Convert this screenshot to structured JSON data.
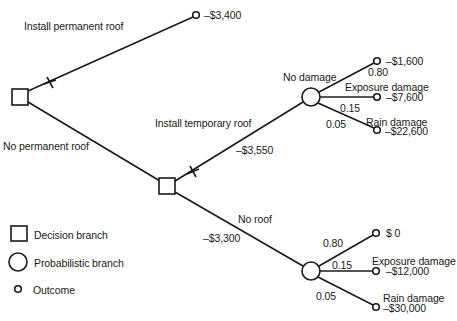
{
  "diagram": {
    "type": "decision-tree",
    "root": {
      "kind": "decision",
      "branches": [
        {
          "label": "Install permanent roof",
          "rejected": true,
          "outcome": "–$3,400"
        },
        {
          "label": "No permanent roof",
          "node": {
            "kind": "decision",
            "branches": [
              {
                "label": "Install temporary roof",
                "cost": "–$3,550",
                "rejected": true,
                "node": {
                  "kind": "probabilistic",
                  "outcomes": [
                    {
                      "label": "No damage",
                      "probability": "0.80",
                      "value": "–$1,600"
                    },
                    {
                      "label": "Exposure damage",
                      "probability": "0.15",
                      "value": "–$7,600"
                    },
                    {
                      "label": "Rain damage",
                      "probability": "0.05",
                      "value": "–$22,600"
                    }
                  ]
                }
              },
              {
                "label": "No roof",
                "cost": "–$3,300",
                "node": {
                  "kind": "probabilistic",
                  "outcomes": [
                    {
                      "label": "",
                      "probability": "0.80",
                      "value": "$ 0"
                    },
                    {
                      "label": "Exposure damage",
                      "probability": "0.15",
                      "value": "–$12,000"
                    },
                    {
                      "label": "Rain damage",
                      "probability": "0.05",
                      "value": "–$30,000"
                    }
                  ]
                }
              }
            ]
          }
        }
      ]
    }
  },
  "labels": {
    "install_permanent": "Install permanent roof",
    "permanent_value": "–$3,400",
    "no_permanent": "No permanent roof",
    "install_temporary": "Install temporary roof",
    "temporary_cost": "–$3,550",
    "no_roof": "No roof",
    "no_roof_cost": "–$3,300",
    "upper": {
      "no_damage": "No damage",
      "p1": "0.80",
      "v1": "–$1,600",
      "exposure": "Exposure damage",
      "p2": "0.15",
      "v2": "–$7,600",
      "rain": "Rain damage",
      "p3": "0.05",
      "v3": "–$22,600"
    },
    "lower": {
      "p1": "0.80",
      "v1": "$ 0",
      "exposure": "Exposure damage",
      "p2": "0.15",
      "v2": "–$12,000",
      "rain": "Rain damage",
      "p3": "0.05",
      "v3": "–$30,000"
    }
  },
  "legend": {
    "decision": "Decision branch",
    "probabilistic": "Probabilistic branch",
    "outcome": "Outcome"
  }
}
